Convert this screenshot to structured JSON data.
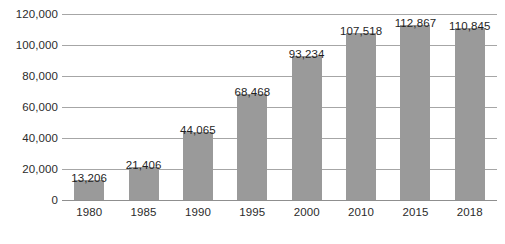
{
  "chart_data": {
    "type": "bar",
    "title": "",
    "subtitle": "",
    "xlabel": "",
    "ylabel": "",
    "categories": [
      "1980",
      "1985",
      "1990",
      "1995",
      "2000",
      "2010",
      "2015",
      "2018"
    ],
    "values": [
      13206,
      21406,
      44065,
      68468,
      93234,
      107518,
      112867,
      110845
    ],
    "value_labels": [
      "13,206",
      "21,406",
      "44,065",
      "68,468",
      "93,234",
      "107,518",
      "112,867",
      "110,845"
    ],
    "ylim": [
      0,
      120000
    ],
    "y_ticks": [
      0,
      20000,
      40000,
      60000,
      80000,
      100000,
      120000
    ],
    "y_tick_labels": [
      "0",
      "20,000",
      "40,000",
      "60,000",
      "80,000",
      "100,000",
      "120,000"
    ],
    "grid": true,
    "legend": false,
    "legend_position": "none",
    "series": [
      {
        "name": "",
        "values": [
          13206,
          21406,
          44065,
          68468,
          93234,
          107518,
          112867,
          110845
        ]
      }
    ],
    "colors": {
      "bar_fill": "#9a9a9a",
      "gridline": "#a6a6a6",
      "axis_line": "#8f8f8f",
      "label_text": "#1f1f1f",
      "tick_text": "#2b2b2b",
      "background": "#ffffff"
    }
  }
}
